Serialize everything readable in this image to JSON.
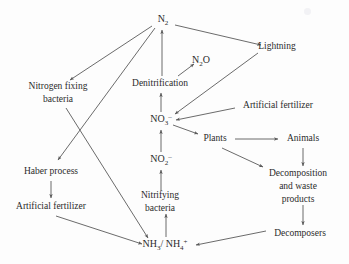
{
  "diagram": {
    "type": "flow-diagram",
    "width": 349,
    "height": 264,
    "colors": {
      "background": "#fdfdfd",
      "text": "#2b2b2b",
      "edge": "#5a5a5a"
    },
    "nodes": [
      {
        "id": "n2",
        "label": "N2",
        "display": "N₂",
        "x": 163,
        "y": 20,
        "kind": "formula"
      },
      {
        "id": "n2o",
        "label": "N2O",
        "display": "N₂O",
        "x": 201,
        "y": 61,
        "kind": "formula"
      },
      {
        "id": "lightning",
        "label": "Lightning",
        "display": "Lightning",
        "x": 277,
        "y": 47,
        "kind": "text"
      },
      {
        "id": "nitrogen_fix",
        "label": "Nitrogen fixing bacteria",
        "display": "Nitrogen fixing\nbacteria",
        "x": 58,
        "y": 93,
        "kind": "text"
      },
      {
        "id": "denitrif",
        "label": "Denitrification",
        "display": "Denitrification",
        "x": 160,
        "y": 84,
        "kind": "text"
      },
      {
        "id": "art_fert_top",
        "label": "Artificial fertilizer",
        "display": "Artificial fertilizer",
        "x": 278,
        "y": 106,
        "kind": "text"
      },
      {
        "id": "no3",
        "label": "NO3-",
        "display": "NO₃⁻",
        "x": 161,
        "y": 120,
        "kind": "formula"
      },
      {
        "id": "plants",
        "label": "Plants",
        "display": "Plants",
        "x": 215,
        "y": 139,
        "kind": "text"
      },
      {
        "id": "animals",
        "label": "Animals",
        "display": "Animals",
        "x": 303,
        "y": 139,
        "kind": "text"
      },
      {
        "id": "haber",
        "label": "Haber process",
        "display": "Haber process",
        "x": 51,
        "y": 172,
        "kind": "text"
      },
      {
        "id": "no2",
        "label": "NO2-",
        "display": "NO₂⁻",
        "x": 161,
        "y": 160,
        "kind": "formula"
      },
      {
        "id": "decomposition",
        "label": "Decomposition and waste products",
        "display": "Decomposition\nand waste\nproducts",
        "x": 298,
        "y": 180,
        "kind": "text"
      },
      {
        "id": "art_fert_left",
        "label": "Artificial fertilizer",
        "display": "Artificial fertilizer",
        "x": 51,
        "y": 207,
        "kind": "text"
      },
      {
        "id": "nitrifying",
        "label": "Nitrifying bacteria",
        "display": "Nitrifying\nbacteria",
        "x": 160,
        "y": 202,
        "kind": "text"
      },
      {
        "id": "decomposers",
        "label": "Decomposers",
        "display": "Decomposers",
        "x": 300,
        "y": 234,
        "kind": "text"
      },
      {
        "id": "nh3_nh4",
        "label": "NH3/ NH4+",
        "display": "NH₃/ NH₄⁺",
        "x": 165,
        "y": 245,
        "kind": "formula"
      }
    ],
    "edges": [
      {
        "id": "e-n2-nitrogenfix",
        "from": "n2",
        "to": "nitrogen_fix",
        "label": "N2 to Nitrogen fixing bacteria"
      },
      {
        "id": "e-n2-haber",
        "from": "n2",
        "to": "haber",
        "label": "N2 to Haber process"
      },
      {
        "id": "e-n2-lightning",
        "from": "n2",
        "to": "lightning",
        "label": "N2 to Lightning"
      },
      {
        "id": "e-denitrif-n2",
        "from": "denitrif",
        "to": "n2",
        "label": "Denitrification to N2"
      },
      {
        "id": "e-denitrif-n2o",
        "from": "denitrif",
        "to": "n2o",
        "label": "Denitrification to N2O"
      },
      {
        "id": "e-no3-denitrif",
        "from": "no3",
        "to": "denitrif",
        "label": "NO3- to Denitrification"
      },
      {
        "id": "e-lightning-no3",
        "from": "lightning",
        "to": "no3",
        "label": "Lightning to NO3-"
      },
      {
        "id": "e-artfert-no3",
        "from": "art_fert_top",
        "to": "no3",
        "label": "Artificial fertilizer to NO3-"
      },
      {
        "id": "e-no3-plants",
        "from": "no3",
        "to": "plants",
        "label": "NO3- to Plants"
      },
      {
        "id": "e-no2-no3",
        "from": "no2",
        "to": "no3",
        "label": "NO2- to NO3-"
      },
      {
        "id": "e-nitrifying-no2",
        "from": "nitrifying",
        "to": "no2",
        "label": "Nitrifying bacteria to NO2-"
      },
      {
        "id": "e-nh4-nitrifying",
        "from": "nh3_nh4",
        "to": "nitrifying",
        "label": "NH3/NH4+ to Nitrifying bacteria"
      },
      {
        "id": "e-nitrogenfix-nh4",
        "from": "nitrogen_fix",
        "to": "nh3_nh4",
        "label": "Nitrogen fixing bacteria to NH3/NH4+"
      },
      {
        "id": "e-haber-artfert",
        "from": "haber",
        "to": "art_fert_left",
        "label": "Haber process to Artificial fertilizer"
      },
      {
        "id": "e-artfertleft-nh4",
        "from": "art_fert_left",
        "to": "nh3_nh4",
        "label": "Artificial fertilizer to NH3/NH4+"
      },
      {
        "id": "e-plants-animals",
        "from": "plants",
        "to": "animals",
        "label": "Plants to Animals"
      },
      {
        "id": "e-plants-decomp",
        "from": "plants",
        "to": "decomposition",
        "label": "Plants to Decomposition and waste products"
      },
      {
        "id": "e-animals-decomp",
        "from": "animals",
        "to": "decomposition",
        "label": "Animals to Decomposition and waste products"
      },
      {
        "id": "e-decomp-decomposers",
        "from": "decomposition",
        "to": "decomposers",
        "label": "Decomposition and waste products to Decomposers"
      },
      {
        "id": "e-decomposers-nh4",
        "from": "decomposers",
        "to": "nh3_nh4",
        "label": "Decomposers to NH3/NH4+"
      }
    ]
  }
}
